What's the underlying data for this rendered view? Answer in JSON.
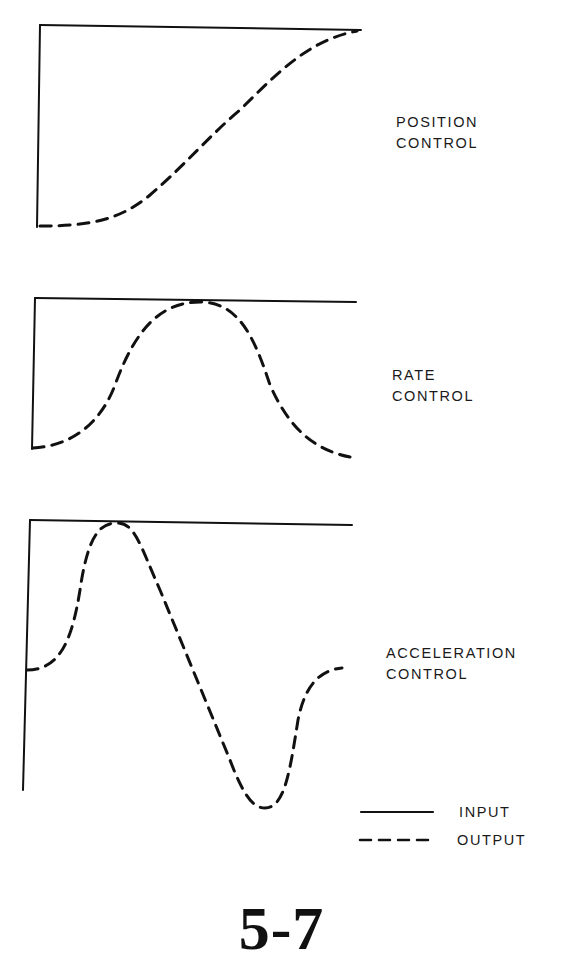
{
  "panels": [
    {
      "id": "position",
      "label_line1": "POSITION",
      "label_line2": "CONTROL"
    },
    {
      "id": "rate",
      "label_line1": "RATE",
      "label_line2": "CONTROL"
    },
    {
      "id": "acceleration",
      "label_line1": "ACCELERATION",
      "label_line2": "CONTROL"
    }
  ],
  "legend": {
    "input_label": "INPUT",
    "output_label": "OUTPUT"
  },
  "figure_number": "5-7",
  "colors": {
    "ink": "#111111",
    "background": "#ffffff"
  }
}
